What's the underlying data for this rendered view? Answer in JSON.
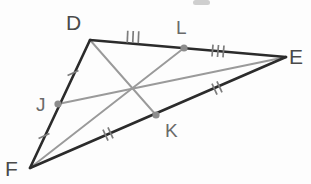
{
  "figure": {
    "width": 311,
    "height": 184,
    "background_color": "#fdfdfd"
  },
  "colors": {
    "triangle_side": "#2b2b2b",
    "median": "#9a9a9a",
    "tick": "#7d7d7d",
    "midpoint_dot": "#8c8c8c",
    "vertex_label": "#4a4a4a",
    "midpoint_label": "#6a6a6a"
  },
  "vertices": [
    {
      "id": "D",
      "label": "D",
      "x": 90,
      "y": 40,
      "label_x": 66,
      "label_y": 30
    },
    {
      "id": "E",
      "label": "E",
      "x": 286,
      "y": 57,
      "label_x": 289,
      "label_y": 64
    },
    {
      "id": "F",
      "label": "F",
      "x": 30,
      "y": 168,
      "label_x": 5,
      "label_y": 176
    }
  ],
  "midpoints": [
    {
      "id": "J",
      "label": "J",
      "on_segment": "DF",
      "x": 58,
      "y": 104,
      "label_x": 36,
      "label_y": 111
    },
    {
      "id": "K",
      "label": "K",
      "on_segment": "FE",
      "x": 156,
      "y": 115,
      "label_x": 165,
      "label_y": 137
    },
    {
      "id": "L",
      "label": "L",
      "on_segment": "DE",
      "x": 184,
      "y": 48,
      "label_x": 176,
      "label_y": 34
    }
  ],
  "triangle_sides": [
    {
      "name": "side-DE",
      "from": "D",
      "to": "E"
    },
    {
      "name": "side-EF",
      "from": "E",
      "to": "F"
    },
    {
      "name": "side-FD",
      "from": "F",
      "to": "D"
    }
  ],
  "medians": [
    {
      "name": "median-DK",
      "from": "D",
      "to": "K"
    },
    {
      "name": "median-EJ",
      "from": "E",
      "to": "J"
    },
    {
      "name": "median-FL",
      "from": "F",
      "to": "L"
    }
  ],
  "centroid": {
    "x": 133,
    "y": 87
  },
  "tick_groups": [
    {
      "name": "ticks-DL",
      "segment": "D-L",
      "count": 3,
      "cx": 133,
      "cy": 37,
      "angle_deg": 2.5
    },
    {
      "name": "ticks-LE",
      "segment": "L-E",
      "count": 3,
      "cx": 218,
      "cy": 51,
      "angle_deg": 4.8
    },
    {
      "name": "ticks-DJ",
      "segment": "D-J",
      "count": 1,
      "cx": 73,
      "cy": 73,
      "angle_deg": 65
    },
    {
      "name": "ticks-JF",
      "segment": "J-F",
      "count": 1,
      "cx": 44,
      "cy": 136,
      "angle_deg": 65
    },
    {
      "name": "ticks-FK",
      "segment": "F-K",
      "count": 2,
      "cx": 108,
      "cy": 134,
      "angle_deg": -25
    },
    {
      "name": "ticks-KE",
      "segment": "K-E",
      "count": 2,
      "cx": 217,
      "cy": 88,
      "angle_deg": -25
    }
  ],
  "artifact": {
    "name": "top-edge-crop-artifact",
    "x": 193,
    "y": 0,
    "width": 17,
    "height": 5
  }
}
